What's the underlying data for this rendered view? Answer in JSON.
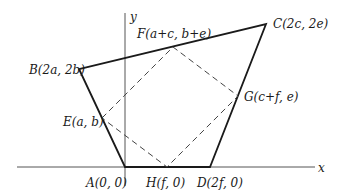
{
  "diagram": {
    "axes": {
      "x_label": "x",
      "y_label": "y"
    },
    "points": {
      "A": {
        "label": "A(0, 0)",
        "px": [
          125,
          167
        ]
      },
      "B": {
        "label": "B(2a, 2b)",
        "px": [
          79,
          69
        ]
      },
      "C": {
        "label": "C(2c, 2e)",
        "px": [
          266,
          24
        ]
      },
      "D": {
        "label": "D(2f, 0)",
        "px": [
          210,
          167
        ]
      },
      "E": {
        "label": "E(a, b)",
        "px": [
          102,
          118
        ]
      },
      "F": {
        "label": "F(a+c, b+e)",
        "px": [
          173,
          47
        ]
      },
      "G": {
        "label": "G(c+f, e)",
        "px": [
          238,
          96
        ]
      },
      "H": {
        "label": "H(f, 0)",
        "px": [
          167,
          167
        ]
      }
    },
    "quadrilateral_solid": [
      "A",
      "B",
      "C",
      "D"
    ],
    "quadrilateral_dashed": [
      "E",
      "F",
      "G",
      "H"
    ],
    "colors": {
      "solid_line": "#1a1a1a",
      "axis_line": "#555555",
      "dashed_line": "#444444"
    }
  }
}
